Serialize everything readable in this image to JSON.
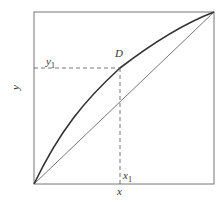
{
  "diagram": {
    "type": "equilibrium-curve",
    "axes": {
      "xlabel": "x",
      "ylabel": "y"
    },
    "point": {
      "label": "D"
    },
    "guides": {
      "x_label": "x",
      "x_sub": "1",
      "y_label": "y",
      "y_sub": "1"
    },
    "curves": [
      {
        "name": "equilibrium-curve",
        "style": "solid-thick"
      },
      {
        "name": "diagonal-line",
        "style": "solid-thin"
      }
    ],
    "colors": {
      "line": "#333333",
      "frame": "#555555",
      "dash": "#555555"
    }
  }
}
